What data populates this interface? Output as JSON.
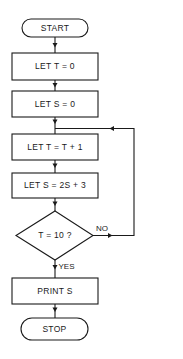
{
  "flowchart": {
    "nodes": [
      {
        "id": "start",
        "type": "terminator",
        "label": "START"
      },
      {
        "id": "init_t",
        "type": "process",
        "label": "LET T = 0"
      },
      {
        "id": "init_s",
        "type": "process",
        "label": "LET S = 0"
      },
      {
        "id": "inc_t",
        "type": "process",
        "label": "LET T = T + 1"
      },
      {
        "id": "update_s",
        "type": "process",
        "label": "LET S = 2S + 3"
      },
      {
        "id": "check",
        "type": "decision",
        "label": "T = 10 ?"
      },
      {
        "id": "print",
        "type": "process",
        "label": "PRINT S"
      },
      {
        "id": "stop",
        "type": "terminator",
        "label": "STOP"
      }
    ],
    "edges": [
      {
        "from": "start",
        "to": "init_t",
        "label": ""
      },
      {
        "from": "init_t",
        "to": "init_s",
        "label": ""
      },
      {
        "from": "init_s",
        "to": "inc_t",
        "label": ""
      },
      {
        "from": "inc_t",
        "to": "update_s",
        "label": ""
      },
      {
        "from": "update_s",
        "to": "check",
        "label": ""
      },
      {
        "from": "check",
        "to": "inc_t",
        "label": "NO"
      },
      {
        "from": "check",
        "to": "print",
        "label": "YES"
      },
      {
        "from": "print",
        "to": "stop",
        "label": ""
      }
    ],
    "edge_labels": {
      "no": "NO",
      "yes": "YES"
    }
  }
}
